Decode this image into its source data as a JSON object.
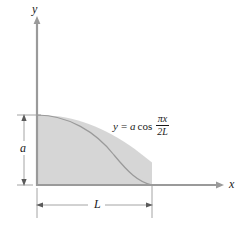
{
  "figure": {
    "type": "math-diagram",
    "background_color": "#ffffff",
    "shade_color": "#d6d6d6",
    "line_color": "#8a8a8a",
    "text_color": "#1a1a1a"
  },
  "axes": {
    "y_label": "y",
    "x_label": "x",
    "origin_px": [
      37,
      185
    ],
    "x_axis_end_px": [
      222,
      185
    ],
    "y_axis_top_px": [
      37,
      18
    ]
  },
  "dimensions": {
    "height_label": "a",
    "width_label": "L",
    "height_extent_px": [
      115,
      185
    ],
    "width_extent_px": [
      37,
      152
    ]
  },
  "equation": {
    "lhs": "y",
    "equals": "=",
    "amplitude": "a",
    "function": "cos",
    "numerator": "πx",
    "denominator": "2L",
    "full_text": "y = a cos πx/2L"
  },
  "curve": {
    "kind": "cosine",
    "start_px": [
      37,
      115
    ],
    "end_px": [
      152,
      185
    ],
    "peak_value_label": "a",
    "quarter_period_label": "L"
  }
}
